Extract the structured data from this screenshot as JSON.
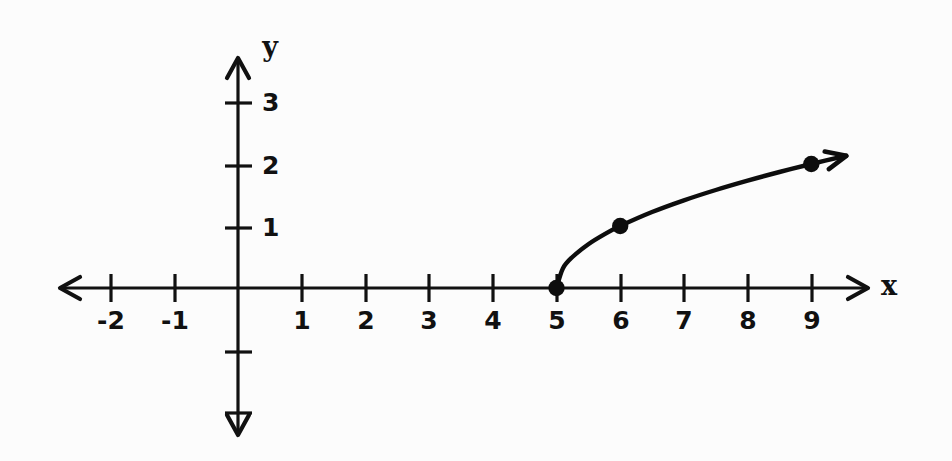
{
  "figure": {
    "background_color": "#fcfcfc",
    "ink_color": "#111111",
    "axis_labels": {
      "x": "x",
      "y": "y"
    }
  },
  "chart_data": {
    "type": "line",
    "title": "",
    "subtitle": "",
    "xlabel": "x",
    "ylabel": "y",
    "grid": false,
    "legend": null,
    "xlim": [
      -2.8,
      9.9
    ],
    "ylim": [
      -2.4,
      3.7
    ],
    "x_ticks": [
      -2,
      -1,
      1,
      2,
      3,
      4,
      5,
      6,
      7,
      8,
      9
    ],
    "x_tick_labels": [
      "-2",
      "-1",
      "1",
      "2",
      "3",
      "4",
      "5",
      "6",
      "7",
      "8",
      "9"
    ],
    "y_ticks": [
      1,
      2,
      3
    ],
    "y_tick_labels": [
      "1",
      "2",
      "3"
    ],
    "y_minor_ticks_unlabeled": [
      -1,
      -2
    ],
    "series": [
      {
        "name": "y = sqrt(x - 5)",
        "equation": "y = √(x − 5)",
        "domain": [
          5,
          9.55
        ],
        "arrow_end": true,
        "x": [
          5.0,
          5.1,
          5.25,
          5.5,
          5.75,
          6.0,
          6.5,
          7.0,
          7.5,
          8.0,
          8.5,
          9.0,
          9.55
        ],
        "y": [
          0.0,
          0.316,
          0.5,
          0.707,
          0.866,
          1.0,
          1.225,
          1.414,
          1.581,
          1.732,
          1.871,
          2.0,
          2.133
        ]
      }
    ],
    "marked_points": [
      {
        "label": "(5, 0)",
        "x": 5,
        "y": 0
      },
      {
        "label": "(6, 1)",
        "x": 6,
        "y": 1
      },
      {
        "label": "(9, 2)",
        "x": 9,
        "y": 2
      }
    ],
    "axes_have_arrows": {
      "x_left": true,
      "x_right": true,
      "y_up": true,
      "y_down": true
    }
  }
}
